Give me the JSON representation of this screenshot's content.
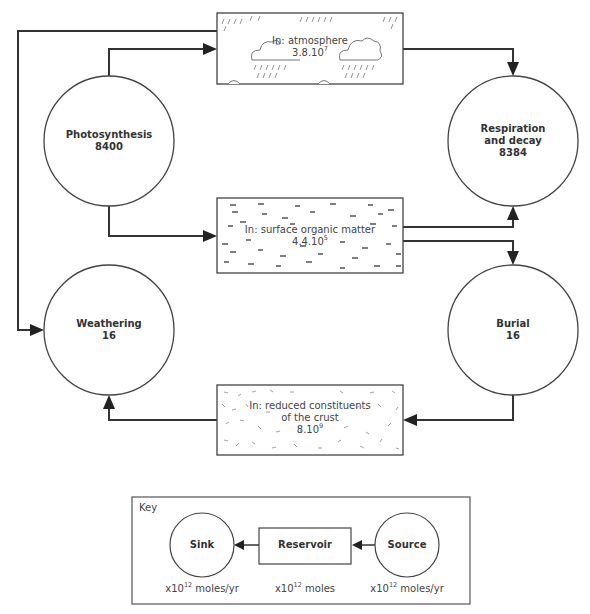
{
  "diagram": {
    "type": "carbon-cycle-flow",
    "reservoirs": [
      {
        "id": "atmosphere",
        "label": "In: atmosphere",
        "value_mantissa": "3.8.10",
        "value_exp": "7",
        "pattern": "rain-clouds"
      },
      {
        "id": "organic",
        "label": "In: surface organic matter",
        "value_mantissa": "4.4.10",
        "value_exp": "5",
        "pattern": "dashes"
      },
      {
        "id": "crust",
        "label_line1": "In: reduced constituents",
        "label_line2": "of the crust",
        "value_mantissa": "8.10",
        "value_exp": "9",
        "pattern": "scatter"
      }
    ],
    "processes": [
      {
        "id": "photosynthesis",
        "name": "Photosynthesis",
        "value": "8400"
      },
      {
        "id": "respiration",
        "name_line1": "Respiration",
        "name_line2": "and decay",
        "value": "8384"
      },
      {
        "id": "weathering",
        "name": "Weathering",
        "value": "16"
      },
      {
        "id": "burial",
        "name": "Burial",
        "value": "16"
      }
    ],
    "flows": [
      {
        "from": "photosynthesis",
        "to": "atmosphere"
      },
      {
        "from": "photosynthesis",
        "to": "organic"
      },
      {
        "from": "atmosphere",
        "to": "respiration"
      },
      {
        "from": "organic",
        "to": "respiration"
      },
      {
        "from": "organic",
        "to": "burial"
      },
      {
        "from": "burial",
        "to": "crust"
      },
      {
        "from": "crust",
        "to": "weathering"
      },
      {
        "from": "atmosphere",
        "to": "weathering"
      }
    ]
  },
  "key": {
    "title": "Key",
    "sink_label": "Sink",
    "reservoir_label": "Reservoir",
    "source_label": "Source",
    "sink_unit_prefix": "x10",
    "sink_unit_exp": "12",
    "sink_unit_suffix": " moles/yr",
    "reservoir_unit_prefix": "x10",
    "reservoir_unit_exp": "12",
    "reservoir_unit_suffix": " moles",
    "source_unit_prefix": "x10",
    "source_unit_exp": "12",
    "source_unit_suffix": " moles/yr"
  },
  "colors": {
    "line": "#333333",
    "background": "#ffffff",
    "text": "#333333"
  }
}
